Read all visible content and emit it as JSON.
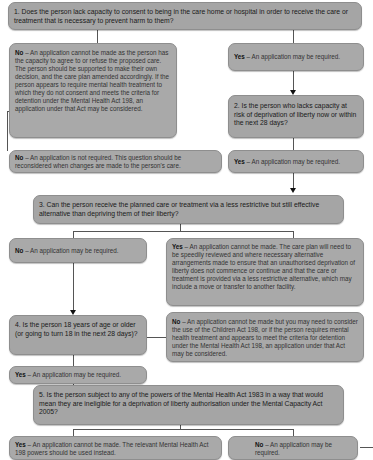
{
  "flowchart": {
    "q1": "1. Does the person lack capacity to consent to being in the care home or hospital in order to receive the care or treatment that is necessary to prevent harm to them?",
    "q1_no_label": "No",
    "q1_no_text": " – An application cannot be made as the person has the capacity to agree to or refuse the proposed care. The person should be supported to make their own decision, and the care plan amended accordingly. If the person appears to require mental health treatment to which they do not consent and meets the criteria for detention under the Mental Health Act 198, an application under that Act may be considered.",
    "q1_yes_label": "Yes",
    "q1_yes_text": " – An application may be required.",
    "q2": "2. Is the person who lacks capacity at risk of deprivation of liberty now or within the next 28 days?",
    "q2_no_label": "No",
    "q2_no_text": " – An application is not required. This question should be reconsidered when changes are made to the person's care.",
    "q2_yes_label": "Yes",
    "q2_yes_text": " – An application may be required.",
    "q3": "3. Can the person receive the planned care or treatment via a less restrictive but still effective alternative than depriving them of their liberty?",
    "q3_no_label": "No",
    "q3_no_text": " – An application may be required.",
    "q3_yes_label": "Yes",
    "q3_yes_text": " – An application cannot be made. The care plan will need to be speedily reviewed and where necessary alternative arrangements made to ensure that an unauthorised deprivation of liberty does not commence or continue and that the care or treatment is provided via a less restrictive alternative, which may include a move or transfer to another facility.",
    "q4": "4. Is the person 18 years of age or older (or going to turn 18 in the next 28 days)?",
    "q4_no_label": "No",
    "q4_no_text": " – An application cannot be made but you may need to consider the use of the Children Act 198, or if the person requires mental health treatment and appears to meet the criteria for detention under the Mental Health Act 198, an application under that Act may be considered.",
    "q4_yes_label": "Yes",
    "q4_yes_text": " – An application may be required.",
    "q5": "5. Is the person subject to any of the powers of the Mental Health Act 1983 in a way that would mean they are ineligible for a deprivation of liberty authorisation under the Mental Capacity Act 2005?",
    "q5_yes_label": "Yes",
    "q5_yes_text": " – An application cannot be made. The relevant Mental Health Act 198 powers should be used instead.",
    "q5_no_label": "No",
    "q5_no_text": " – An application may be required."
  }
}
